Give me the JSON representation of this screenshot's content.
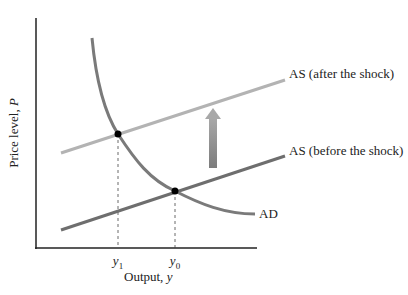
{
  "axes": {
    "ylabel_text": "Price level, ",
    "ylabel_var": "P",
    "xlabel_text": "Output, ",
    "xlabel_var": "y"
  },
  "ticks": [
    {
      "var": "y",
      "sub": "1"
    },
    {
      "var": "y",
      "sub": "0"
    }
  ],
  "curves": {
    "as_after": "AS (after the shock)",
    "as_before": "AS (before the shock)",
    "ad": "AD"
  },
  "colors": {
    "axis": "#222222",
    "ad": "#7a7a7a",
    "as_after": "#b0b0b0",
    "as_before": "#707070",
    "arrow": "#8a8a8a",
    "points": "#000000"
  }
}
